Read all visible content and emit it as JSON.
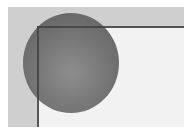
{
  "figure": {
    "colors": {
      "background": "#ffffff",
      "outer_field": "#cfcfcf",
      "inner_field": "#f2f2f2",
      "circle": "#727272",
      "lines": "#444444"
    }
  }
}
